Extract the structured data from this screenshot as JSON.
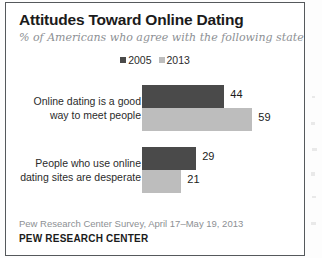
{
  "figure": {
    "title": "Attitudes Toward Online Dating",
    "subtitle": "% of Americans who agree with the following statements",
    "source_note": "Pew Research Center Survey, April 17–May 19, 2013",
    "brand": "PEW RESEARCH CENTER"
  },
  "legend": {
    "items": [
      {
        "label": "2005",
        "color": "#4a4a4a"
      },
      {
        "label": "2013",
        "color": "#bdbdbd"
      }
    ]
  },
  "colors": {
    "series_2005": "#4a4a4a",
    "series_2013": "#bdbdbd",
    "title": "#1b1b1b",
    "subtitle": "#8d9094",
    "frame": "#55595c",
    "background": "#ffffff"
  },
  "chart_data": {
    "type": "bar",
    "orientation": "horizontal",
    "title": "Attitudes Toward Online Dating",
    "subtitle": "% of Americans who agree with the following statements",
    "xlabel": "",
    "ylabel": "",
    "xlim": [
      0,
      100
    ],
    "grid": false,
    "legend_position": "top-center",
    "categories": [
      "Online dating is a good way to meet people",
      "People who use online dating sites are desperate"
    ],
    "category_lines": [
      [
        "Online dating is a good",
        "way to meet people"
      ],
      [
        "People who use online",
        "dating sites are desperate"
      ]
    ],
    "series": [
      {
        "name": "2005",
        "color": "#4a4a4a",
        "values": [
          44,
          29
        ]
      },
      {
        "name": "2013",
        "color": "#bdbdbd",
        "values": [
          59,
          21
        ]
      }
    ],
    "value_labels": [
      [
        "44",
        "59"
      ],
      [
        "29",
        "21"
      ]
    ],
    "annotations": [
      "Pew Research Center Survey, April 17–May 19, 2013",
      "PEW RESEARCH CENTER"
    ]
  }
}
